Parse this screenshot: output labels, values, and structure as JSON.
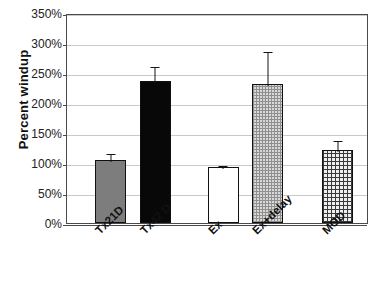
{
  "chart_data": {
    "type": "bar",
    "title": "",
    "xlabel": "",
    "ylabel": "Percent windup",
    "ylim": [
      0,
      350
    ],
    "ytick_values": [
      0,
      50,
      100,
      150,
      200,
      250,
      300,
      350
    ],
    "ytick_labels": [
      "0%",
      "50%",
      "100%",
      "150%",
      "200%",
      "250%",
      "300%",
      "350%"
    ],
    "grid": "horizontal",
    "legend": "none",
    "categories": [
      "Tx21D",
      "Tx42 D",
      "Ex",
      "Ex+delay",
      "MOD"
    ],
    "values": [
      105,
      236,
      93,
      231,
      122
    ],
    "errors": [
      13,
      27,
      5,
      58,
      18
    ],
    "bars": [
      {
        "category": "Tx21D",
        "value": 105,
        "error": 13,
        "fill": "solid-gray",
        "color": "#7d7d7d"
      },
      {
        "category": "Tx42 D",
        "value": 236,
        "error": 27,
        "fill": "solid-black",
        "color": "#080808"
      },
      {
        "category": "Ex",
        "value": 93,
        "error": 5,
        "fill": "white",
        "color": "#ffffff"
      },
      {
        "category": "Ex+delay",
        "value": 231,
        "error": 58,
        "fill": "dotted",
        "color": "#d8d8d8"
      },
      {
        "category": "MOD",
        "value": 122,
        "error": 18,
        "fill": "crosshatch",
        "color": "#efefef"
      }
    ],
    "colors": {
      "gridline": "#c9c9c9",
      "axis": "#4a4a4a",
      "text": "#111111",
      "error": "#151515",
      "background": "#ffffff"
    }
  }
}
